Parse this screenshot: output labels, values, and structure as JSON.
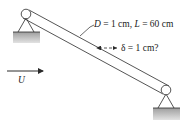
{
  "figure": {
    "dimension_label": {
      "D_symbol": "D",
      "D_value": " = 1 cm,  ",
      "L_symbol": "L",
      "L_value": " = 60 cm"
    },
    "deflection_label": {
      "text": "δ = 1 cm?"
    },
    "flow_label": {
      "symbol": "U"
    },
    "colors": {
      "line": "#2a2a2a",
      "ground_fill": "#b8b8b8"
    }
  }
}
